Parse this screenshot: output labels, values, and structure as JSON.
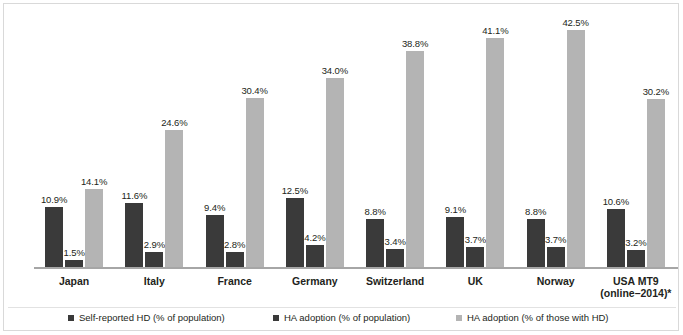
{
  "chart_data": {
    "type": "bar",
    "title": "",
    "subtitle": "",
    "xlabel": "",
    "ylabel": "",
    "ylim": [
      0,
      45
    ],
    "grid": false,
    "legend_position": "bottom",
    "value_label_suffix": "%",
    "categories": [
      "Japan",
      "Italy",
      "France",
      "Germany",
      "Switzerland",
      "UK",
      "Norway",
      "USA MT9 (online–2014)*"
    ],
    "category_lines": [
      [
        "Japan"
      ],
      [
        "Italy"
      ],
      [
        "France"
      ],
      [
        "Germany"
      ],
      [
        "Switzerland"
      ],
      [
        "UK"
      ],
      [
        "Norway"
      ],
      [
        "USA MT9",
        "(online–2014)*"
      ]
    ],
    "series": [
      {
        "name": "Self-reported HD (% of population)",
        "color": "#3a3a3a",
        "values": [
          10.9,
          11.6,
          9.4,
          12.5,
          8.8,
          9.1,
          8.8,
          10.6
        ],
        "labels": [
          "10.9%",
          "11.6%",
          "9.4%",
          "12.5%",
          "8.8%",
          "9.1%",
          "8.8%",
          "10.6%"
        ]
      },
      {
        "name": "HA adoption (% of population)",
        "color": "#3a3a3a",
        "values": [
          1.5,
          2.9,
          2.8,
          4.2,
          3.4,
          3.7,
          3.7,
          3.2
        ],
        "labels": [
          "1.5%",
          "2.9%",
          "2.8%",
          "4.2%",
          "3.4%",
          "3.7%",
          "3.7%",
          "3.2%"
        ]
      },
      {
        "name": "HA adoption (% of those with HD)",
        "color": "#b4b4b4",
        "values": [
          14.1,
          24.6,
          30.4,
          34.0,
          38.8,
          41.1,
          42.5,
          30.2
        ],
        "labels": [
          "14.1%",
          "24.6%",
          "30.4%",
          "34.0%",
          "38.8%",
          "41.1%",
          "42.5%",
          "30.2%"
        ]
      }
    ]
  },
  "legend": {
    "items": [
      {
        "label": "Self-reported HD (% of population)",
        "color": "#3a3a3a"
      },
      {
        "label": "HA adoption (% of population)",
        "color": "#3a3a3a"
      },
      {
        "label": "HA adoption (% of those with HD)",
        "color": "#b4b4b4"
      }
    ]
  }
}
